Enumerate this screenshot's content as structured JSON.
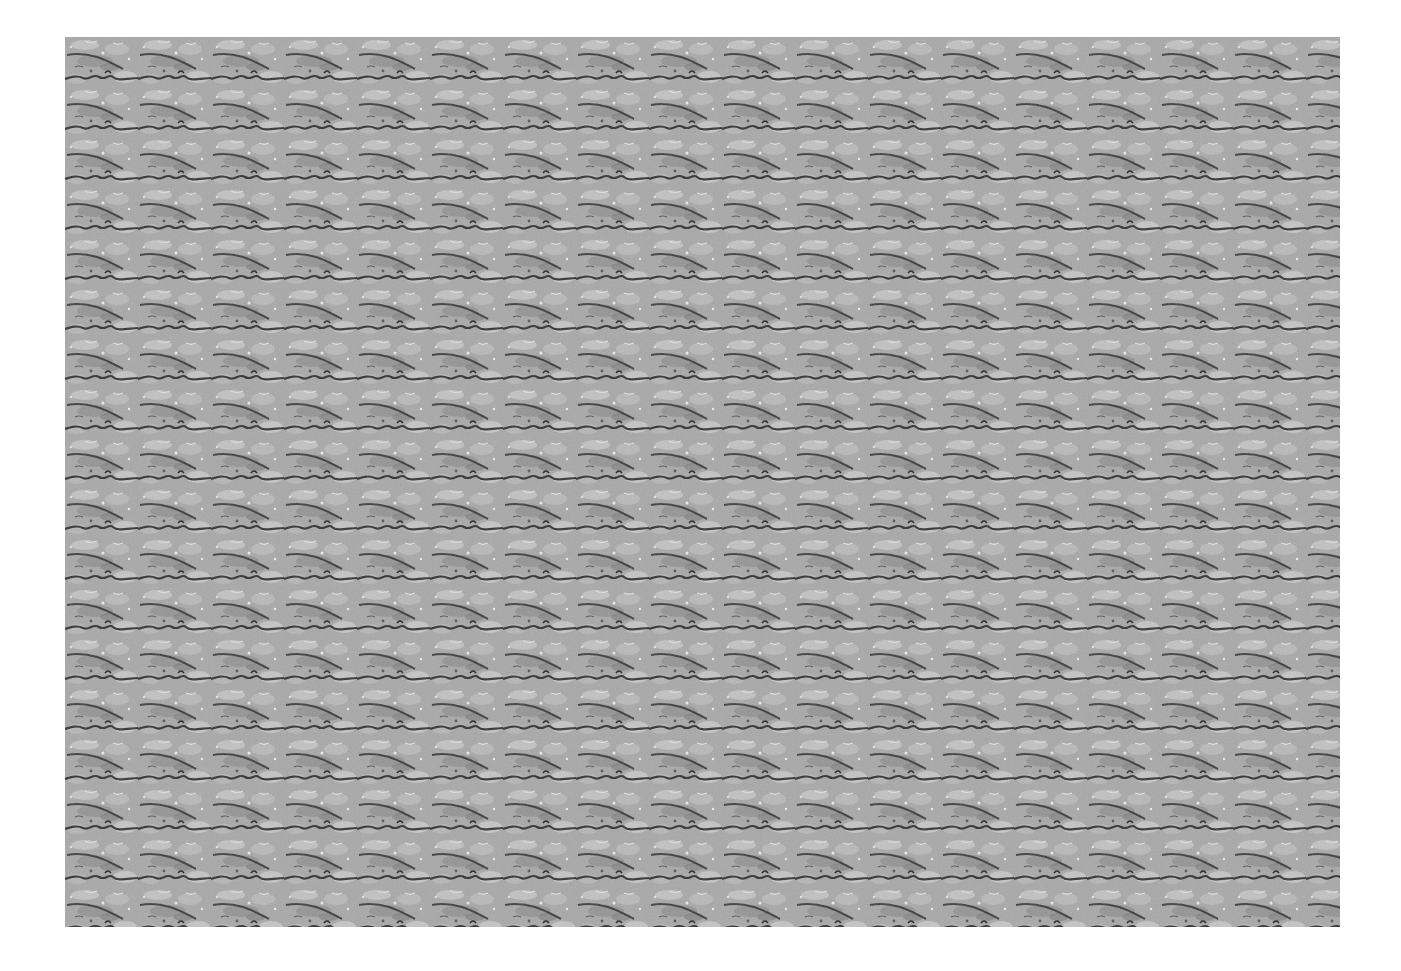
{
  "image": {
    "kind": "autostereogram",
    "description": "Repeating grey textured tile pattern (magic-eye style stereogram)",
    "tile_width_px": 73,
    "tile_height_px": 50,
    "columns": 17,
    "rows": 18,
    "colors": {
      "background": "#ffffff",
      "base_grey": "#a8a8a8",
      "light_grey": "#d0d0d0",
      "mid_grey": "#8a8a8a",
      "dark_line": "#2a2a2a"
    }
  }
}
